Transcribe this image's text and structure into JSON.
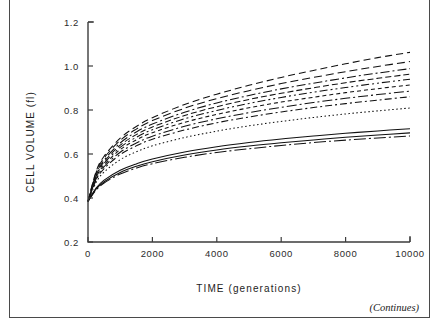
{
  "figure": {
    "continues_note": "(Continues)",
    "clipped_header_text": "",
    "frame_color": "#4a4a4a"
  },
  "chart_data": {
    "type": "line",
    "title": "",
    "xlabel": "TIME (generations)",
    "ylabel": "CELL VOLUME (fl)",
    "xlim": [
      0,
      10000
    ],
    "ylim": [
      0.2,
      1.2
    ],
    "xticks": [
      0,
      2000,
      4000,
      6000,
      8000,
      10000
    ],
    "xtick_labels": [
      "0",
      "2000",
      "4000",
      "6000",
      "8000",
      "10000"
    ],
    "yticks": [
      0.2,
      0.4,
      0.6,
      0.8,
      1.0,
      1.2
    ],
    "ytick_labels": [
      "0.2",
      "0.4",
      "0.6",
      "0.8",
      "1.0",
      "1.2"
    ],
    "grid": false,
    "legend": "none",
    "legend_position": "none",
    "x": [
      0,
      250,
      500,
      1000,
      1500,
      2000,
      3000,
      4000,
      5000,
      6000,
      7000,
      8000,
      9000,
      10000
    ],
    "series": [
      {
        "name": "line-1",
        "style": "dashed-long",
        "dasharray": "7,4",
        "values": [
          0.385,
          0.52,
          0.59,
          0.672,
          0.725,
          0.765,
          0.825,
          0.872,
          0.912,
          0.948,
          0.98,
          1.01,
          1.038,
          1.062
        ]
      },
      {
        "name": "line-2",
        "style": "dashed-long",
        "dasharray": "8,4",
        "values": [
          0.385,
          0.515,
          0.582,
          0.662,
          0.713,
          0.752,
          0.808,
          0.852,
          0.888,
          0.92,
          0.948,
          0.974,
          0.998,
          1.02
        ]
      },
      {
        "name": "line-3",
        "style": "dash-dot",
        "dasharray": "9,3,2,3",
        "values": [
          0.385,
          0.508,
          0.572,
          0.65,
          0.7,
          0.736,
          0.79,
          0.832,
          0.866,
          0.896,
          0.922,
          0.946,
          0.968,
          0.988
        ]
      },
      {
        "name": "line-4",
        "style": "dashed-medium",
        "dasharray": "6,3",
        "values": [
          0.385,
          0.502,
          0.565,
          0.64,
          0.688,
          0.723,
          0.775,
          0.815,
          0.848,
          0.876,
          0.901,
          0.924,
          0.944,
          0.963
        ]
      },
      {
        "name": "line-5",
        "style": "dash-dot-dot",
        "dasharray": "8,3,2,3,2,3",
        "values": [
          0.385,
          0.498,
          0.558,
          0.63,
          0.676,
          0.71,
          0.76,
          0.798,
          0.83,
          0.857,
          0.881,
          0.902,
          0.922,
          0.94
        ]
      },
      {
        "name": "line-6",
        "style": "dashed-short",
        "dasharray": "4,3",
        "values": [
          0.385,
          0.492,
          0.55,
          0.62,
          0.664,
          0.697,
          0.744,
          0.78,
          0.81,
          0.836,
          0.858,
          0.879,
          0.897,
          0.914
        ]
      },
      {
        "name": "line-7",
        "style": "dash-dot",
        "dasharray": "10,3,2,3",
        "values": [
          0.385,
          0.486,
          0.542,
          0.608,
          0.65,
          0.681,
          0.726,
          0.76,
          0.788,
          0.812,
          0.834,
          0.853,
          0.87,
          0.886
        ]
      },
      {
        "name": "line-8",
        "style": "dash-dot",
        "dasharray": "7,3,2,3",
        "values": [
          0.385,
          0.48,
          0.534,
          0.597,
          0.637,
          0.667,
          0.709,
          0.742,
          0.768,
          0.791,
          0.811,
          0.829,
          0.845,
          0.86
        ]
      },
      {
        "name": "line-9",
        "style": "dotted-fine",
        "dasharray": "1.5,2.5",
        "values": [
          0.385,
          0.47,
          0.518,
          0.574,
          0.61,
          0.637,
          0.675,
          0.704,
          0.728,
          0.748,
          0.766,
          0.782,
          0.796,
          0.809
        ]
      },
      {
        "name": "line-10",
        "style": "solid",
        "dasharray": "none",
        "values": [
          0.385,
          0.445,
          0.481,
          0.526,
          0.555,
          0.577,
          0.609,
          0.633,
          0.652,
          0.668,
          0.682,
          0.694,
          0.705,
          0.715
        ]
      },
      {
        "name": "line-11",
        "style": "solid",
        "dasharray": "none",
        "values": [
          0.385,
          0.44,
          0.474,
          0.516,
          0.544,
          0.565,
          0.595,
          0.618,
          0.636,
          0.651,
          0.664,
          0.676,
          0.686,
          0.696
        ]
      },
      {
        "name": "line-12",
        "style": "dash-dot-long",
        "dasharray": "12,3,2,3",
        "values": [
          0.385,
          0.436,
          0.468,
          0.509,
          0.536,
          0.556,
          0.585,
          0.607,
          0.624,
          0.639,
          0.652,
          0.663,
          0.673,
          0.682
        ]
      }
    ]
  }
}
